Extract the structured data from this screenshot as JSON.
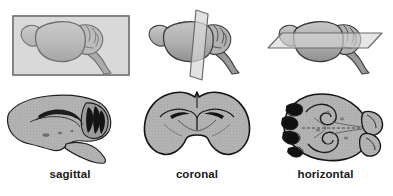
{
  "figure": {
    "background_color": "#ffffff",
    "panels": [
      {
        "id": "sagittal",
        "caption": "sagittal",
        "plane_shape": "rectangle",
        "plane_orientation": "parallel to midline, viewed face-on",
        "diagram_alt": "Rodent brain in lateral view with sagittal cutting plane shown as a rectangle covering the whole brain",
        "section_alt": "Sagittal histological section of rodent brain showing cortex, hippocampus, cerebellar folia and brainstem"
      },
      {
        "id": "coronal",
        "caption": "coronal",
        "plane_shape": "vertical-parallelogram",
        "plane_orientation": "vertical, perpendicular to the long axis",
        "diagram_alt": "Rodent brain in lateral view with a vertical coronal cutting plane passing through the cerebrum",
        "section_alt": "Coronal histological section of rodent brain showing symmetric hemispheres, corpus callosum and lateral ventricles"
      },
      {
        "id": "horizontal",
        "caption": "horizontal",
        "plane_shape": "horizontal-parallelogram",
        "plane_orientation": "horizontal, parallel to the dorsal surface",
        "diagram_alt": "Rodent brain in lateral view with a flat horizontal cutting plane passing through the middle of the brain",
        "section_alt": "Horizontal histological section of rodent brain showing olfactory bulbs, hippocampi and cerebellum"
      }
    ],
    "anatomy_labels": [
      "olfactory bulb",
      "cerebrum",
      "cerebellum",
      "brainstem"
    ],
    "colors": {
      "brain_fill": "#a8a8a8",
      "brain_fill_light": "#bdbdbd",
      "brain_outline": "#3a3a3a",
      "plane_fill": "#d9d9d9",
      "plane_outline": "#6e6e6e",
      "tissue_fill": "#b0b0b0",
      "tissue_outline": "#1c1c1c",
      "caption_color": "#1a1a1a",
      "background": "#ffffff"
    }
  }
}
